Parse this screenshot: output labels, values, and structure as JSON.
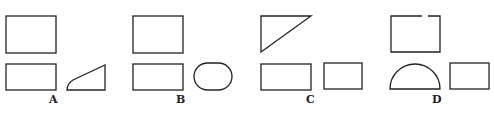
{
  "figure": {
    "options": [
      {
        "label": "A",
        "shapes": [
          "rectangle",
          "rectangle",
          "rounded-wedge"
        ]
      },
      {
        "label": "B",
        "shapes": [
          "rectangle",
          "rectangle",
          "oval"
        ]
      },
      {
        "label": "C",
        "shapes": [
          "right-triangle",
          "rectangle",
          "rectangle"
        ]
      },
      {
        "label": "D",
        "shapes": [
          "rectangle-with-gap",
          "semicircle",
          "rectangle"
        ]
      }
    ],
    "stroke_color": "#222222"
  }
}
